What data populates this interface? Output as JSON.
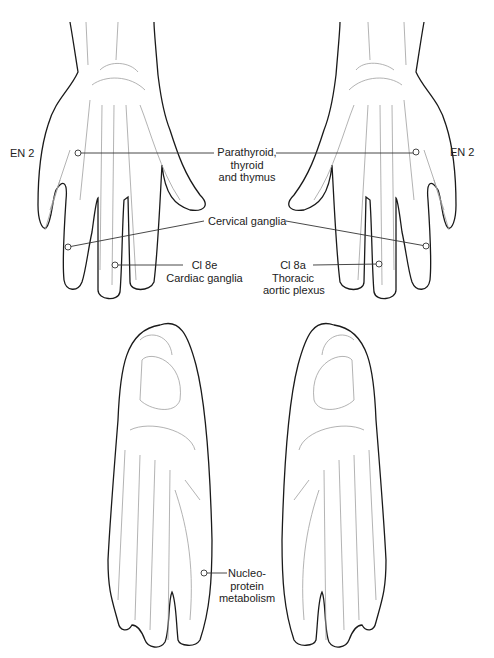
{
  "diagram": {
    "colors": {
      "outline": "#1a1a1a",
      "bone": "#9a9a9a",
      "leader": "#333333",
      "background": "#ffffff"
    },
    "hands": {
      "left_label_en2": "EN 2",
      "right_label_en2": "EN 2",
      "parathyroid": [
        "Parathyroid,",
        "thyroid",
        "and thymus"
      ],
      "cervical": "Cervical ganglia",
      "left_ci": [
        "Cl 8e",
        "Cardiac ganglia"
      ],
      "right_ci": [
        "Cl 8a",
        "Thoracic",
        "aortic plexus"
      ]
    },
    "feet": {
      "nucleo": [
        "Nucleo-",
        "protein",
        "metabolism"
      ]
    }
  }
}
